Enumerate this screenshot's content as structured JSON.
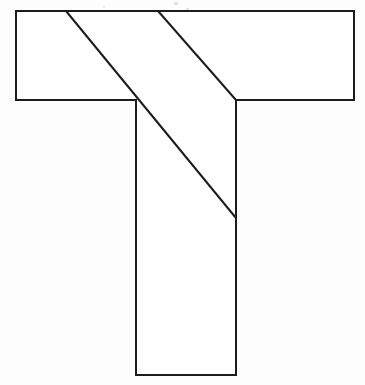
{
  "figure": {
    "background_color": "#fdfdfd",
    "fill_color": "#ffffff",
    "stroke_color": "#1c1c1c",
    "stroke_width": 2,
    "canvas": {
      "width": 365,
      "height": 385
    },
    "outline_label": "t-shape-outline",
    "outline_points": "16,11 354,11 354,100 236,100 236,375 136,375 136,100 16,100",
    "vertices": [
      {
        "name": "crossbar-top-left",
        "x": 16,
        "y": 11
      },
      {
        "name": "crossbar-top-right",
        "x": 354,
        "y": 11
      },
      {
        "name": "crossbar-bottom-right",
        "x": 354,
        "y": 100
      },
      {
        "name": "stem-top-right",
        "x": 236,
        "y": 100
      },
      {
        "name": "stem-bottom-right",
        "x": 236,
        "y": 375
      },
      {
        "name": "stem-bottom-left",
        "x": 136,
        "y": 375
      },
      {
        "name": "stem-top-left",
        "x": 136,
        "y": 100
      },
      {
        "name": "crossbar-bottom-left",
        "x": 16,
        "y": 100
      }
    ],
    "cuts": [
      {
        "name": "diagonal-cut-long",
        "x1": 66,
        "y1": 11,
        "x2": 236,
        "y2": 218,
        "note": "passes through stem-top-left corner (136,100)"
      },
      {
        "name": "diagonal-cut-short",
        "x1": 158,
        "y1": 11,
        "x2": 236,
        "y2": 100,
        "note": "ends at stem-top-right corner (236,100)"
      }
    ],
    "dimensions": {
      "crossbar_width": 338,
      "crossbar_height": 89,
      "stem_width": 100,
      "stem_height": 275,
      "total_height": 364
    },
    "artifacts": [
      {
        "name": "scan-speckle-a",
        "x": 174,
        "y": 2,
        "width": 4,
        "height": 3
      },
      {
        "name": "scan-speckle-b",
        "x": 186,
        "y": 8,
        "width": 3,
        "height": 2
      },
      {
        "name": "scan-speckle-c",
        "x": 103,
        "y": 6,
        "width": 2,
        "height": 2
      }
    ]
  }
}
